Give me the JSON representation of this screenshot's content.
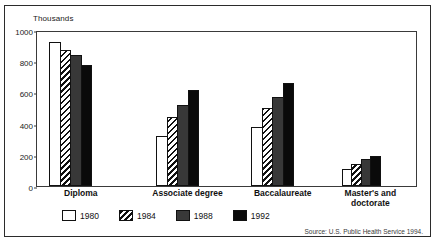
{
  "axis": {
    "units_label": "Thousands",
    "yticks": [
      "0",
      "200",
      "400",
      "600",
      "800",
      "1000"
    ]
  },
  "legend": {
    "items": [
      {
        "label": "1980",
        "key": "1980"
      },
      {
        "label": "1984",
        "key": "1984"
      },
      {
        "label": "1988",
        "key": "1988"
      },
      {
        "label": "1992",
        "key": "1992"
      }
    ]
  },
  "source": {
    "text": "Source: U.S. Public Health Service 1994."
  },
  "colors": {
    "series_1980": "#ffffff",
    "series_1984": "#ffffff",
    "series_1988": "#383838",
    "series_1992": "#0a0a0a",
    "outline": "#111111",
    "frame": "#2b2b2b"
  },
  "chart_data": {
    "type": "bar",
    "title": "",
    "subtitle": "",
    "xlabel": "",
    "ylabel": "Thousands",
    "ylim": [
      0,
      1000
    ],
    "yticks": [
      0,
      200,
      400,
      600,
      800,
      1000
    ],
    "grid": false,
    "legend_position": "bottom",
    "categories": [
      "Diploma",
      "Associate degree",
      "Baccalaureate",
      "Master's and doctorate"
    ],
    "series": [
      {
        "name": "1980",
        "values": [
          920,
          320,
          380,
          110
        ]
      },
      {
        "name": "1984",
        "values": [
          875,
          440,
          500,
          140
        ]
      },
      {
        "name": "1988",
        "values": [
          840,
          520,
          570,
          170
        ]
      },
      {
        "name": "1992",
        "values": [
          775,
          615,
          660,
          195
        ]
      }
    ]
  }
}
